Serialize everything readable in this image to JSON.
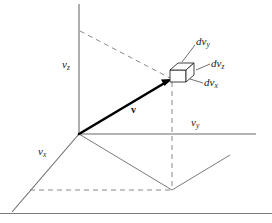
{
  "figure": {
    "colors": {
      "axis": "#6b6b6b",
      "dashed": "#8a8a8a",
      "vector": "#000000",
      "box": "#2b2b2b",
      "leader": "#4a4a4a",
      "text": "#1a1a1a",
      "baseline": "#7a7a7a",
      "background": "#ffffff"
    },
    "axes": [
      {
        "name": "vz",
        "label_main": "v",
        "label_sub": "z",
        "x": 62,
        "y": 59
      },
      {
        "name": "vy",
        "label_main": "v",
        "label_sub": "y",
        "x": 191,
        "y": 117
      },
      {
        "name": "vx",
        "label_main": "v",
        "label_sub": "x",
        "x": 38,
        "y": 146
      }
    ],
    "elements": [
      {
        "name": "dvy",
        "label_main": "dv",
        "label_sub": "y",
        "x": 196,
        "y": 39
      },
      {
        "name": "dvz",
        "label_main": "dv",
        "label_sub": "z",
        "x": 211,
        "y": 62
      },
      {
        "name": "dvx",
        "label_main": "dv",
        "label_sub": "x",
        "x": 204,
        "y": 80
      }
    ],
    "vector": {
      "name": "v",
      "label": "v",
      "label_x": 131,
      "label_y": 108
    }
  }
}
